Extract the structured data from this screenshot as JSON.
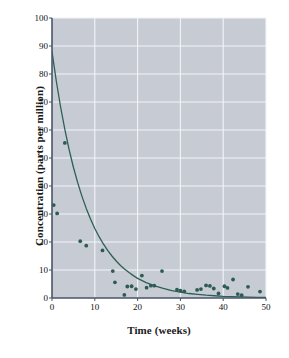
{
  "chart_data": {
    "type": "scatter",
    "title": "",
    "xlabel": "Time (weeks)",
    "ylabel": "Concentration (parts per million)",
    "xlim": [
      0,
      50
    ],
    "ylim": [
      0,
      100
    ],
    "xticks": [
      0,
      10,
      20,
      30,
      40,
      50
    ],
    "yticks": [
      0,
      10,
      20,
      30,
      40,
      50,
      60,
      70,
      80,
      90,
      100
    ],
    "grid": true,
    "legend": "none",
    "colors": {
      "plot_background": "#c7ccd4",
      "gridline": "#f2f4f7",
      "marker": "#2d5b53",
      "curve": "#2c5f55",
      "axis": "#4a5568",
      "text": "#111111",
      "page_background": "#ffffff"
    },
    "series": [
      {
        "name": "Observed concentration",
        "type": "scatter",
        "marker": "circle",
        "points": [
          [
            0.4,
            33.2
          ],
          [
            1.2,
            30.2
          ],
          [
            3.0,
            55.4
          ],
          [
            6.6,
            20.3
          ],
          [
            8.0,
            18.7
          ],
          [
            11.8,
            17.0
          ],
          [
            14.2,
            9.6
          ],
          [
            14.7,
            5.6
          ],
          [
            16.9,
            1.1
          ],
          [
            17.6,
            4.1
          ],
          [
            18.6,
            4.2
          ],
          [
            19.6,
            3.2
          ],
          [
            21.0,
            8.0
          ],
          [
            22.1,
            3.7
          ],
          [
            23.1,
            4.4
          ],
          [
            23.9,
            4.4
          ],
          [
            25.7,
            9.6
          ],
          [
            29.2,
            3.0
          ],
          [
            30.0,
            2.6
          ],
          [
            30.9,
            2.4
          ],
          [
            33.9,
            2.9
          ],
          [
            34.8,
            3.2
          ],
          [
            36.0,
            4.5
          ],
          [
            36.9,
            4.3
          ],
          [
            37.8,
            3.4
          ],
          [
            38.9,
            1.6
          ],
          [
            40.3,
            4.2
          ],
          [
            41.0,
            3.6
          ],
          [
            42.3,
            6.6
          ],
          [
            43.4,
            1.4
          ],
          [
            44.3,
            1.0
          ],
          [
            45.8,
            4.0
          ],
          [
            48.6,
            2.3
          ]
        ]
      },
      {
        "name": "Exponential decay fit",
        "type": "line",
        "model": "exponential_decay",
        "curve": [
          [
            0.0,
            88.0
          ],
          [
            1.0,
            77.5
          ],
          [
            2.0,
            68.3
          ],
          [
            3.0,
            60.2
          ],
          [
            4.0,
            53.0
          ],
          [
            5.0,
            46.7
          ],
          [
            6.0,
            41.2
          ],
          [
            7.0,
            36.3
          ],
          [
            8.0,
            32.0
          ],
          [
            9.0,
            28.2
          ],
          [
            10.0,
            24.8
          ],
          [
            11.0,
            21.9
          ],
          [
            12.0,
            19.3
          ],
          [
            13.0,
            17.0
          ],
          [
            14.0,
            15.0
          ],
          [
            15.0,
            13.2
          ],
          [
            16.0,
            11.6
          ],
          [
            17.0,
            10.3
          ],
          [
            18.0,
            9.1
          ],
          [
            19.0,
            8.0
          ],
          [
            20.0,
            7.0
          ],
          [
            22.0,
            5.5
          ],
          [
            24.0,
            4.3
          ],
          [
            26.0,
            3.4
          ],
          [
            28.0,
            2.6
          ],
          [
            30.0,
            2.1
          ],
          [
            32.0,
            1.6
          ],
          [
            34.0,
            1.3
          ],
          [
            36.0,
            1.0
          ],
          [
            38.0,
            0.8
          ],
          [
            40.0,
            0.6
          ],
          [
            42.0,
            0.5
          ],
          [
            44.0,
            0.4
          ],
          [
            46.0,
            0.3
          ],
          [
            48.0,
            0.25
          ],
          [
            50.0,
            0.2
          ]
        ]
      }
    ]
  }
}
